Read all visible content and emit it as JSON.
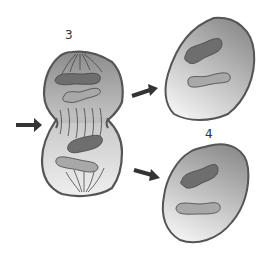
{
  "diagram": {
    "labels": {
      "stage_3": "3",
      "stage_4": "4"
    },
    "colors": {
      "background": "#ffffff",
      "membrane": "#555555",
      "cytoplasm_dark": "#8a8a8a",
      "cytoplasm_light": "#ececec",
      "chromosome_dark": "#6e6e6e",
      "chromosome_light": "#a8a8a8",
      "arrow": "#333333"
    },
    "elements": [
      {
        "id": "dividing-cell",
        "stage": "3",
        "description": "Dividing cell with cleavage furrow and spindle fibers"
      },
      {
        "id": "daughter-cell-top",
        "description": "Daughter cell, upper right"
      },
      {
        "id": "daughter-cell-bottom",
        "stage": "4",
        "description": "Daughter cell, lower right"
      },
      {
        "id": "arrow-left",
        "points_to": "cleavage furrow"
      },
      {
        "id": "arrow-top-right",
        "points_to": "daughter-cell-top"
      },
      {
        "id": "arrow-bottom-right",
        "points_to": "daughter-cell-bottom"
      }
    ]
  }
}
